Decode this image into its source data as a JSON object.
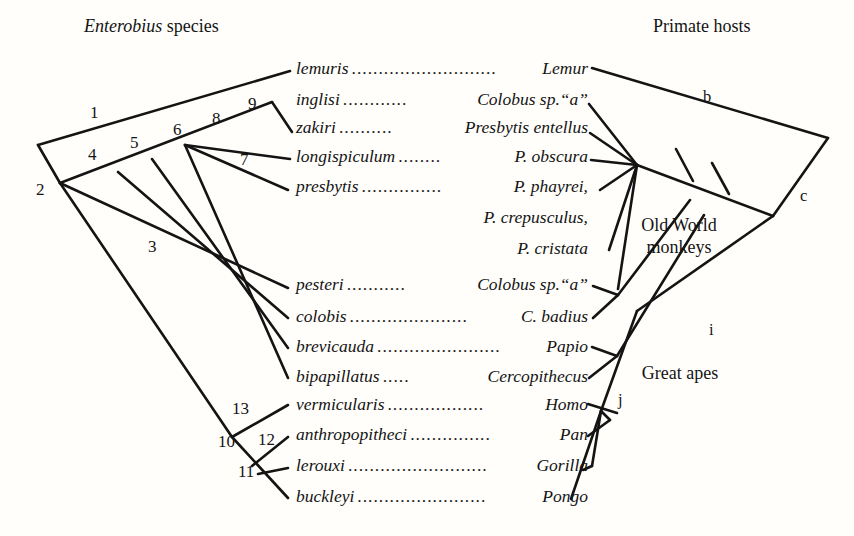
{
  "headers": {
    "left_italic": "Enterobius",
    "left_rest": " species",
    "right": "Primate hosts"
  },
  "colors": {
    "ink": "#141414",
    "background": "#fffefb"
  },
  "species_rows": [
    {
      "species": "lemuris",
      "leader": "...........................",
      "host": "Lemur",
      "host_style": "italic"
    },
    {
      "species": "inglisi",
      "leader": "............",
      "host": "Colobus sp.“a”",
      "host_style": "mixed"
    },
    {
      "species": "zakiri",
      "leader": "..........",
      "host": "Presbytis entellus",
      "host_style": "italic"
    },
    {
      "species": "longispiculum",
      "leader": "........",
      "host": "P. obscura",
      "host_style": "italic"
    },
    {
      "species": "presbytis",
      "leader": "...............",
      "host": "P. phayrei,",
      "host_style": "italic"
    },
    {
      "species": "pesteri",
      "leader": "...........",
      "host": "Colobus sp.“a”",
      "host_style": "mixed"
    },
    {
      "species": "colobis",
      "leader": "......................",
      "host": "C. badius",
      "host_style": "italic"
    },
    {
      "species": "brevicauda",
      "leader": ".......................",
      "host": "Papio",
      "host_style": "italic"
    },
    {
      "species": "bipapillatus",
      "leader": ".....",
      "host": "Cercopithecus",
      "host_style": "italic"
    },
    {
      "species": "vermicularis",
      "leader": "..................",
      "host": "Homo",
      "host_style": "italic"
    },
    {
      "species": "anthropopitheci",
      "leader": "...............",
      "host": "Pan",
      "host_style": "italic"
    },
    {
      "species": "lerouxi",
      "leader": "..........................",
      "host": "Gorilla",
      "host_style": "italic"
    },
    {
      "species": "buckleyi",
      "leader": "........................",
      "host": "Pongo",
      "host_style": "italic"
    }
  ],
  "continuation_hosts": [
    {
      "text": "P. crepusculus,"
    },
    {
      "text": "P. cristata"
    }
  ],
  "parasite_node_numbers": [
    "1",
    "2",
    "3",
    "4",
    "5",
    "6",
    "7",
    "8",
    "9",
    "10",
    "11",
    "12",
    "13"
  ],
  "host_branch_labels": [
    "b",
    "c",
    "i",
    "j"
  ],
  "host_group_labels": [
    {
      "line1": "Old World",
      "line2": "monkeys"
    },
    {
      "line1": "Great apes",
      "line2": ""
    }
  ]
}
